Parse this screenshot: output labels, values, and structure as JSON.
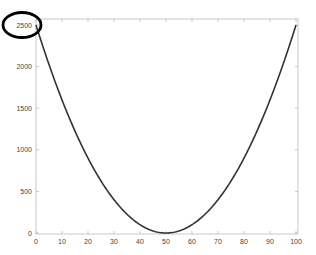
{
  "chart_data": {
    "type": "line",
    "title": "",
    "xlabel": "",
    "ylabel": "",
    "xlim": [
      0,
      100
    ],
    "ylim": [
      0,
      2500
    ],
    "grid": false,
    "legend": null,
    "x_ticks": [
      0,
      10,
      20,
      30,
      40,
      50,
      60,
      70,
      80,
      90,
      100
    ],
    "y_ticks": [
      0,
      500,
      1000,
      1500,
      2000,
      2500
    ],
    "function": "y = (x - 50)^2",
    "series": [
      {
        "name": "(x-50)^2",
        "color": "#333333",
        "x": [
          0,
          5,
          10,
          15,
          20,
          25,
          30,
          35,
          40,
          45,
          50,
          55,
          60,
          65,
          70,
          75,
          80,
          85,
          90,
          95,
          100
        ],
        "y": [
          2500,
          2025,
          1600,
          1225,
          900,
          625,
          400,
          225,
          100,
          25,
          0,
          25,
          100,
          225,
          400,
          625,
          900,
          1225,
          1600,
          2025,
          2500
        ]
      }
    ],
    "annotations": [
      {
        "type": "ellipse",
        "target": "y-tick 2500",
        "color": "#000000"
      }
    ]
  },
  "colors": {
    "axis": "#bbbbbb",
    "line": "#333333",
    "annotation": "#000000"
  }
}
